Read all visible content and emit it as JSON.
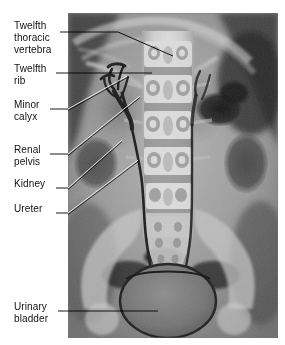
{
  "figure": {
    "kind": "annotated-radiograph",
    "modality": "X-ray urogram (intravenous pyelogram)",
    "view": "anteroposterior abdomen/pelvis"
  },
  "labels": [
    {
      "id": "twelfth-thoracic-vertebra",
      "text": "Twelfth\nthoracic\nvertebra",
      "x": 14,
      "y": 20,
      "lines": 3
    },
    {
      "id": "twelfth-rib",
      "text": "Twelfth\nrib",
      "x": 14,
      "y": 63,
      "lines": 2
    },
    {
      "id": "minor-calyx",
      "text": "Minor\ncalyx",
      "x": 14,
      "y": 99,
      "lines": 2
    },
    {
      "id": "renal-pelvis",
      "text": "Renal\npelvis",
      "x": 14,
      "y": 144,
      "lines": 2
    },
    {
      "id": "kidney",
      "text": "Kidney",
      "x": 14,
      "y": 178,
      "lines": 1
    },
    {
      "id": "ureter",
      "text": "Ureter",
      "x": 14,
      "y": 203,
      "lines": 1
    },
    {
      "id": "urinary-bladder",
      "text": "Urinary\nbladder",
      "x": 14,
      "y": 301,
      "lines": 2
    }
  ],
  "leader_lines": [
    {
      "id": "leader-twelfth-thoracic-vertebra",
      "points": "60,32 118,32 173,56",
      "color": "#000000"
    },
    {
      "id": "leader-twelfth-rib",
      "points": "56,73 152,73",
      "color": "#000000"
    },
    {
      "id": "leader-minor-calyx",
      "points": "50,109 68,109 125,78",
      "color": "#ffffff"
    },
    {
      "id": "leader-renal-pelvis",
      "points": "50,154 68,154 138,97",
      "color": "#ffffff"
    },
    {
      "id": "leader-kidney",
      "points": "56,188 68,188 120,140",
      "color": "#ffffff"
    },
    {
      "id": "leader-ureter",
      "points": "56,213 68,213 136,162",
      "color": "#ffffff"
    },
    {
      "id": "leader-urinary-bladder",
      "points": "58,311 158,311",
      "color": "#000000"
    }
  ],
  "plate": {
    "left": 68,
    "top": 13,
    "width": 210,
    "height": 325,
    "background": "#8f8f8f",
    "regions": [
      {
        "name": "spine-column",
        "tone": "#c9c9c9"
      },
      {
        "name": "vertebral-body-t12",
        "tone": "#d2d2d2"
      },
      {
        "name": "vertebral-body-l1",
        "tone": "#d0d0d0"
      },
      {
        "name": "vertebral-body-l2",
        "tone": "#cfcfcf"
      },
      {
        "name": "vertebral-body-l3",
        "tone": "#cdcdcd"
      },
      {
        "name": "vertebral-body-l4",
        "tone": "#cbcbcb"
      },
      {
        "name": "vertebral-body-l5",
        "tone": "#c8c8c8"
      },
      {
        "name": "sacrum",
        "tone": "#bdbdbd"
      },
      {
        "name": "left-kidney-shadow",
        "tone": "#7d7d7d"
      },
      {
        "name": "right-kidney-shadow",
        "tone": "#828282"
      },
      {
        "name": "opacified-collecting-system",
        "tone": "#2a2a2a"
      },
      {
        "name": "ureter-left",
        "tone": "#232323"
      },
      {
        "name": "ureter-right",
        "tone": "#262626"
      },
      {
        "name": "urinary-bladder",
        "tone": "#6e6e6e"
      },
      {
        "name": "bowel-gas",
        "tone": "#1e1e1e"
      },
      {
        "name": "iliac-crest-left",
        "tone": "#c4c4c4"
      },
      {
        "name": "iliac-crest-right",
        "tone": "#c2c2c2"
      },
      {
        "name": "twelfth-rib-left",
        "tone": "#c6c6c6"
      },
      {
        "name": "twelfth-rib-right",
        "tone": "#c6c6c6"
      },
      {
        "name": "soft-tissue-flank",
        "tone": "#9a9a9a"
      }
    ]
  }
}
